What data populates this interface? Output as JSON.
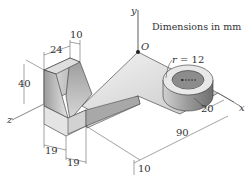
{
  "diagram": {
    "note": "Dimensions in mm",
    "axes": {
      "x": "x",
      "y": "y",
      "z": "z",
      "origin": "O"
    },
    "radius_label": "r = 12",
    "dimensions": {
      "d24": "24",
      "d10_top": "10",
      "d40": "40",
      "d19_a": "19",
      "d19_b": "19",
      "d90": "90",
      "d20": "20",
      "d10_bottom": "10"
    },
    "colors": {
      "background": "#ffffff",
      "line": "#333333",
      "face_light": "#e6e6e6",
      "face_mid": "#bdbdbd",
      "face_dark": "#8a8a8a"
    }
  }
}
